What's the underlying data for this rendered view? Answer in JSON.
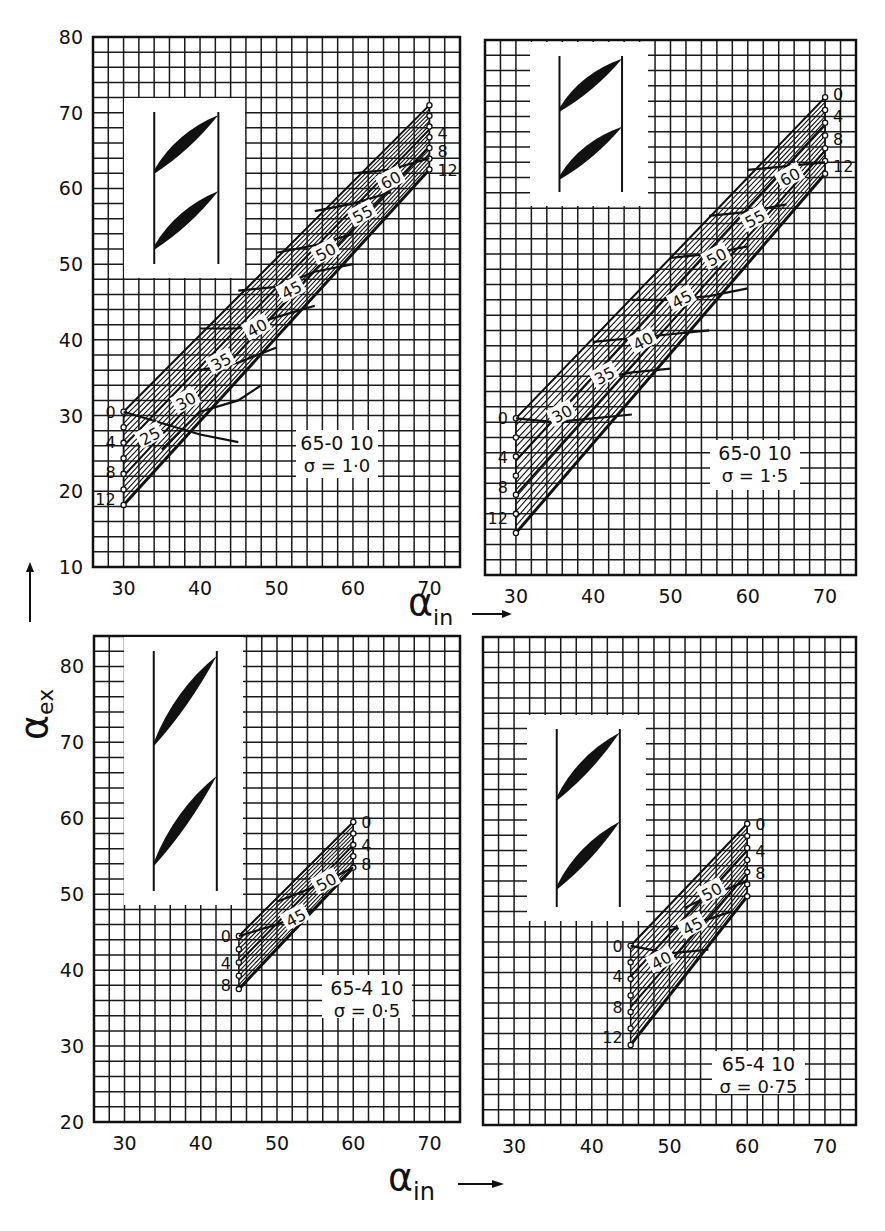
{
  "figure": {
    "y_axis_title": "α",
    "y_axis_title_sub": "ex",
    "x_axis_title": "α",
    "x_axis_title_sub": "in",
    "caption": ""
  },
  "chart_data": [
    {
      "type": "line",
      "id": "top-left",
      "title": "65-0 10",
      "solidity_label": "σ = 1·0",
      "profile": "65-010",
      "solidity": 1.0,
      "xlabel": "α_in",
      "ylabel": "α_ex",
      "xlim": [
        26,
        74
      ],
      "ylim": [
        10,
        80
      ],
      "xticks": [
        30,
        40,
        50,
        60,
        70
      ],
      "yticks": [
        10,
        20,
        30,
        40,
        50,
        60,
        70,
        80
      ],
      "grid": true,
      "grid_step": 2,
      "frame_px": {
        "x0": 93,
        "y0": 37,
        "x1": 460,
        "y1": 567
      },
      "inset_px": {
        "x0": 124,
        "y0": 98,
        "x1": 245,
        "y1": 278
      },
      "label_box_px": {
        "x0": 296,
        "y0": 430,
        "x1": 378,
        "y1": 478
      },
      "incidence_family_labels": [
        "0",
        "4",
        "8",
        "12"
      ],
      "incidence_lines": [
        {
          "i": 0,
          "points": [
            [
              30,
              30.5
            ],
            [
              70,
              71.0
            ]
          ]
        },
        {
          "i": 4,
          "points": [
            [
              30,
              26.0
            ],
            [
              70,
              67.8
            ]
          ]
        },
        {
          "i": 8,
          "points": [
            [
              30,
              22.0
            ],
            [
              70,
              65.5
            ]
          ]
        },
        {
          "i": 12,
          "points": [
            [
              30,
              18.2
            ],
            [
              70,
              62.5
            ]
          ]
        }
      ],
      "extra_hatch_lines": 8,
      "camber_lines": [
        {
          "label": "25",
          "points": [
            [
              30,
              30.5
            ],
            [
              40,
              27.5
            ],
            [
              45,
              26.5
            ]
          ]
        },
        {
          "label": "30",
          "points": [
            [
              35,
              25.5
            ],
            [
              40,
              30.5
            ],
            [
              45,
              32.0
            ],
            [
              48,
              34.0
            ]
          ]
        },
        {
          "label": "35",
          "points": [
            [
              40,
              36.0
            ],
            [
              45,
              37.0
            ],
            [
              50,
              39.0
            ]
          ]
        },
        {
          "label": "40",
          "points": [
            [
              40,
              41.5
            ],
            [
              45,
              41.5
            ],
            [
              50,
              43.0
            ],
            [
              55,
              44.5
            ]
          ]
        },
        {
          "label": "45",
          "points": [
            [
              45,
              46.5
            ],
            [
              50,
              47.0
            ],
            [
              55,
              49.0
            ],
            [
              60,
              50.0
            ]
          ]
        },
        {
          "label": "50",
          "points": [
            [
              50,
              51.5
            ],
            [
              55,
              52.5
            ],
            [
              60,
              54.0
            ]
          ]
        },
        {
          "label": "55",
          "points": [
            [
              55,
              57.0
            ],
            [
              60,
              58.0
            ],
            [
              65,
              59.5
            ]
          ]
        },
        {
          "label": "60",
          "points": [
            [
              60,
              62.0
            ],
            [
              65,
              62.5
            ],
            [
              70,
              64.0
            ]
          ]
        }
      ],
      "family_label_positions": {
        "start": {
          "x": 30,
          "ys": [
            30.5,
            26.5,
            22.5,
            19.0
          ],
          "side": "left"
        },
        "end": {
          "x": 70,
          "ys": [
            71.0,
            67.3,
            65.0,
            62.5
          ],
          "side": "right",
          "visible": [
            "4",
            "8",
            "12"
          ]
        }
      },
      "label_positions": [
        {
          "label": "25",
          "x": 33.5,
          "y": 27.2
        },
        {
          "label": "30",
          "x": 38.2,
          "y": 31.8
        },
        {
          "label": "35",
          "x": 42.8,
          "y": 37.0
        },
        {
          "label": "40",
          "x": 47.5,
          "y": 41.5
        },
        {
          "label": "45",
          "x": 52.0,
          "y": 46.5
        },
        {
          "label": "50",
          "x": 56.5,
          "y": 51.5
        },
        {
          "label": "55",
          "x": 61.3,
          "y": 56.5
        },
        {
          "label": "60",
          "x": 65.0,
          "y": 61.0
        }
      ]
    },
    {
      "type": "line",
      "id": "top-right",
      "title": "65-0 10",
      "solidity_label": "σ = 1·5",
      "profile": "65-010",
      "solidity": 1.5,
      "xlabel": "α_in",
      "ylabel": "α_ex",
      "xlim": [
        26,
        74
      ],
      "ylim": [
        10,
        80
      ],
      "xticks": [
        30,
        40,
        50,
        60,
        70
      ],
      "yticks": [],
      "grid": true,
      "grid_step": 2,
      "frame_px": {
        "x0": 485,
        "y0": 40,
        "x1": 856,
        "y1": 575
      },
      "inset_px": {
        "x0": 530,
        "y0": 42,
        "x1": 648,
        "y1": 206
      },
      "label_box_px": {
        "x0": 710,
        "y0": 440,
        "x1": 800,
        "y1": 490
      },
      "incidence_family_labels": [
        "0",
        "4",
        "8",
        "12"
      ],
      "incidence_lines": [
        {
          "i": 0,
          "points": [
            [
              30,
              30.5
            ],
            [
              70,
              72.5
            ]
          ]
        },
        {
          "i": 4,
          "points": [
            [
              30,
              25.0
            ],
            [
              70,
              69.0
            ]
          ]
        },
        {
          "i": 8,
          "points": [
            [
              30,
              20.5
            ],
            [
              70,
              65.5
            ]
          ]
        },
        {
          "i": 12,
          "points": [
            [
              30,
              15.5
            ],
            [
              70,
              62.5
            ]
          ]
        }
      ],
      "extra_hatch_lines": 8,
      "camber_lines": [
        {
          "label": "30",
          "points": [
            [
              30,
              30.5
            ],
            [
              35,
              30.0
            ],
            [
              40,
              30.5
            ],
            [
              45,
              31.0
            ]
          ]
        },
        {
          "label": "35",
          "points": [
            [
              40,
              35.5
            ],
            [
              45,
              36.5
            ],
            [
              50,
              37.0
            ]
          ]
        },
        {
          "label": "40",
          "points": [
            [
              40,
              40.5
            ],
            [
              45,
              41.0
            ],
            [
              50,
              41.5
            ],
            [
              55,
              42.0
            ]
          ]
        },
        {
          "label": "45",
          "points": [
            [
              45,
              46.0
            ],
            [
              50,
              46.0
            ],
            [
              55,
              46.5
            ],
            [
              60,
              47.5
            ]
          ]
        },
        {
          "label": "50",
          "points": [
            [
              50,
              51.5
            ],
            [
              55,
              52.0
            ],
            [
              60,
              53.0
            ]
          ]
        },
        {
          "label": "55",
          "points": [
            [
              55,
              57.0
            ],
            [
              60,
              57.5
            ],
            [
              65,
              58.5
            ]
          ]
        },
        {
          "label": "60",
          "points": [
            [
              60,
              63.0
            ],
            [
              65,
              63.5
            ],
            [
              70,
              64.0
            ]
          ]
        }
      ],
      "family_label_positions": {
        "start": {
          "x": 30,
          "ys": [
            30.5,
            25.5,
            21.5,
            17.5
          ],
          "side": "left"
        },
        "end": {
          "x": 70,
          "ys": [
            73.0,
            70.0,
            67.0,
            63.5
          ],
          "side": "right",
          "visible": [
            "0",
            "4",
            "8",
            "12"
          ]
        }
      },
      "label_positions": [
        {
          "label": "30",
          "x": 36.0,
          "y": 31.0
        },
        {
          "label": "35",
          "x": 41.5,
          "y": 36.0
        },
        {
          "label": "40",
          "x": 46.5,
          "y": 40.5
        },
        {
          "label": "45",
          "x": 51.5,
          "y": 46.0
        },
        {
          "label": "50",
          "x": 56.0,
          "y": 51.5
        },
        {
          "label": "55",
          "x": 61.0,
          "y": 56.5
        },
        {
          "label": "60",
          "x": 65.5,
          "y": 62.0
        }
      ]
    },
    {
      "type": "line",
      "id": "bottom-left",
      "title": "65-4 10",
      "solidity_label": "σ = 0·5",
      "profile": "65-410",
      "solidity": 0.5,
      "xlabel": "α_in",
      "ylabel": "α_ex",
      "xlim": [
        26,
        74
      ],
      "ylim": [
        20,
        84
      ],
      "xticks": [
        30,
        40,
        50,
        60,
        70
      ],
      "yticks": [
        20,
        30,
        40,
        50,
        60,
        70,
        80
      ],
      "grid": true,
      "grid_step": 2,
      "frame_px": {
        "x0": 94,
        "y0": 636,
        "x1": 460,
        "y1": 1122
      },
      "inset_px": {
        "x0": 124,
        "y0": 637,
        "x1": 243,
        "y1": 905
      },
      "label_box_px": {
        "x0": 322,
        "y0": 975,
        "x1": 412,
        "y1": 1018
      },
      "incidence_family_labels": [
        "0",
        "4",
        "8"
      ],
      "incidence_lines": [
        {
          "i": 0,
          "points": [
            [
              45,
              44.5
            ],
            [
              60,
              59.5
            ]
          ]
        },
        {
          "i": 4,
          "points": [
            [
              45,
              41.0
            ],
            [
              60,
              56.5
            ]
          ]
        },
        {
          "i": 8,
          "points": [
            [
              45,
              37.5
            ],
            [
              60,
              53.5
            ]
          ]
        }
      ],
      "extra_hatch_lines": 5,
      "camber_lines": [
        {
          "label": "45",
          "points": [
            [
              45,
              44.5
            ],
            [
              50,
              46.0
            ],
            [
              55,
              48.0
            ]
          ]
        },
        {
          "label": "50",
          "points": [
            [
              50,
              49.0
            ],
            [
              55,
              51.0
            ],
            [
              60,
              53.5
            ]
          ]
        }
      ],
      "family_label_positions": {
        "start": {
          "x": 45,
          "ys": [
            44.5,
            41.0,
            38.0
          ],
          "side": "left"
        },
        "end": {
          "x": 60,
          "ys": [
            59.5,
            56.5,
            54.0
          ],
          "side": "right",
          "visible": [
            "0",
            "4",
            "8"
          ]
        }
      },
      "label_positions": [
        {
          "label": "45",
          "x": 52.5,
          "y": 46.8
        },
        {
          "label": "50",
          "x": 56.5,
          "y": 51.5
        }
      ]
    },
    {
      "type": "line",
      "id": "bottom-right",
      "title": "65-4 10",
      "solidity_label": "σ = 0·75",
      "profile": "65-410",
      "solidity": 0.75,
      "xlabel": "α_in",
      "ylabel": "α_ex",
      "xlim": [
        26,
        74
      ],
      "ylim": [
        20,
        84
      ],
      "xticks": [
        30,
        40,
        50,
        60,
        70
      ],
      "yticks": [],
      "grid": true,
      "grid_step": 2,
      "frame_px": {
        "x0": 483,
        "y0": 637,
        "x1": 856,
        "y1": 1125
      },
      "inset_px": {
        "x0": 527,
        "y0": 715,
        "x1": 646,
        "y1": 921
      },
      "label_box_px": {
        "x0": 712,
        "y0": 1051,
        "x1": 805,
        "y1": 1094
      },
      "incidence_family_labels": [
        "0",
        "4",
        "8",
        "12"
      ],
      "incidence_lines": [
        {
          "i": 0,
          "points": [
            [
              45,
              43.5
            ],
            [
              60,
              59.5
            ]
          ]
        },
        {
          "i": 4,
          "points": [
            [
              45,
              39.5
            ],
            [
              60,
              56.0
            ]
          ]
        },
        {
          "i": 8,
          "points": [
            [
              45,
              35.5
            ],
            [
              60,
              53.0
            ]
          ]
        },
        {
          "i": 12,
          "points": [
            [
              45,
              30.5
            ],
            [
              60,
              50.0
            ]
          ]
        }
      ],
      "extra_hatch_lines": 8,
      "camber_lines": [
        {
          "label": "40",
          "points": [
            [
              45,
              43.5
            ],
            [
              50,
              42.5
            ],
            [
              55,
              43.0
            ]
          ]
        },
        {
          "label": "45",
          "points": [
            [
              50,
              45.5
            ],
            [
              55,
              47.0
            ],
            [
              58,
              48.0
            ]
          ]
        },
        {
          "label": "50",
          "points": [
            [
              52,
              48.5
            ],
            [
              55,
              50.0
            ],
            [
              60,
              52.0
            ]
          ]
        }
      ],
      "family_label_positions": {
        "start": {
          "x": 45,
          "ys": [
            43.5,
            39.5,
            35.5,
            31.5
          ],
          "side": "left"
        },
        "end": {
          "x": 60,
          "ys": [
            59.5,
            56.0,
            53.0
          ],
          "side": "right",
          "visible": [
            "0",
            "4",
            "8"
          ]
        }
      },
      "label_positions": [
        {
          "label": "40",
          "x": 49.0,
          "y": 41.5
        },
        {
          "label": "45",
          "x": 53.0,
          "y": 46.0
        },
        {
          "label": "50",
          "x": 55.5,
          "y": 50.5
        }
      ]
    }
  ]
}
